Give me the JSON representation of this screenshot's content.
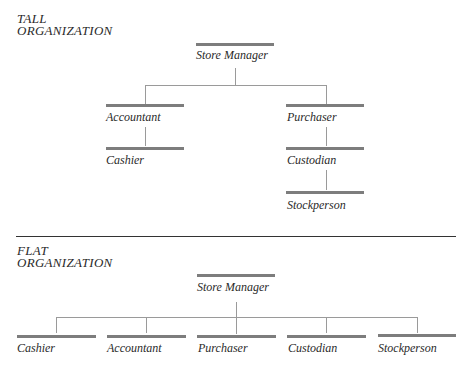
{
  "tall": {
    "title_line1": "TALL",
    "title_line2": "ORGANIZATION",
    "nodes": {
      "store_manager": "Store Manager",
      "accountant": "Accountant",
      "cashier": "Cashier",
      "purchaser": "Purchaser",
      "custodian": "Custodian",
      "stockperson": "Stockperson"
    }
  },
  "flat": {
    "title_line1": "FLAT",
    "title_line2": "ORGANIZATION",
    "nodes": {
      "store_manager": "Store Manager",
      "cashier": "Cashier",
      "accountant": "Accountant",
      "purchaser": "Purchaser",
      "custodian": "Custodian",
      "stockperson": "Stockperson"
    }
  }
}
